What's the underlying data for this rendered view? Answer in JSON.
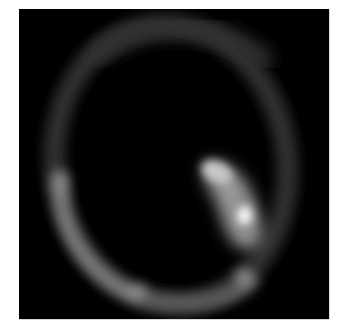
{
  "image": {
    "kind": "grayscale tomographic scan slice",
    "description": "Axial scan slice showing an oval ring-like outline with a bright elongated uptake region on the lower right interior",
    "colors": {
      "background": "#000000",
      "page": "#ffffff",
      "ring": "#5a5a5a",
      "hotspot": "#ffffff"
    }
  }
}
